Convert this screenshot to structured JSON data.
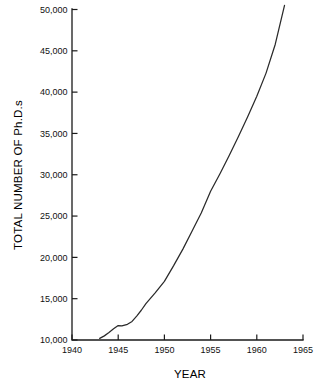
{
  "chart_data": {
    "type": "line",
    "title": "",
    "xlabel": "YEAR",
    "ylabel": "TOTAL NUMBER OF Ph.D.s",
    "xlim": [
      1940,
      1965
    ],
    "ylim": [
      10000,
      50000
    ],
    "grid": false,
    "legend": "none",
    "line_color": "#2a2a2a",
    "background_color": "#ffffff",
    "axis_color": "#1a1a1a",
    "xticks": [
      1940,
      1945,
      1950,
      1955,
      1960,
      1965
    ],
    "xtick_labels": [
      "1940",
      "1945",
      "1950",
      "1955",
      "1960",
      "1965"
    ],
    "yticks": [
      10000,
      15000,
      20000,
      25000,
      30000,
      35000,
      40000,
      45000,
      50000
    ],
    "ytick_labels": [
      "10,000",
      "15,000",
      "20,000",
      "25,000",
      "30,000",
      "35,000",
      "40,000",
      "45,000",
      "50,000"
    ],
    "series": [
      {
        "name": "Total number of Ph.D.s",
        "x": [
          1943.0,
          1943.5,
          1944.0,
          1944.5,
          1945.0,
          1945.4,
          1946.0,
          1946.5,
          1947.0,
          1947.5,
          1948.0,
          1949.0,
          1950.0,
          1951.0,
          1952.0,
          1953.0,
          1954.0,
          1955.0,
          1956.0,
          1957.0,
          1958.0,
          1959.0,
          1960.0,
          1961.0,
          1962.0,
          1963.0
        ],
        "y": [
          10200,
          10500,
          10900,
          11350,
          11750,
          11700,
          11900,
          12250,
          12900,
          13600,
          14400,
          15700,
          17100,
          19000,
          21000,
          23200,
          25400,
          28000,
          30100,
          32300,
          34600,
          37000,
          39500,
          42300,
          45800,
          50500
        ]
      }
    ]
  },
  "axes": {
    "y_axis_title": "TOTAL NUMBER OF Ph.D.s",
    "x_axis_title": "YEAR"
  }
}
